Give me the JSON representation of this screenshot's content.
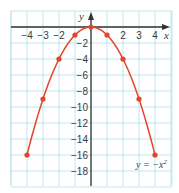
{
  "chart_data": {
    "type": "line",
    "title": "",
    "xlabel": "x",
    "ylabel": "y",
    "xlim": [
      -5,
      5
    ],
    "ylim": [
      -19.5,
      2
    ],
    "grid": true,
    "x_ticks": [
      -4,
      -3,
      -2,
      2,
      3,
      4
    ],
    "x_tick_labels": [
      "−4",
      "−3",
      "−2",
      "2",
      "3",
      "4"
    ],
    "y_ticks": [
      -2,
      -4,
      -6,
      -8,
      -10,
      -12,
      -14,
      -16,
      -18
    ],
    "y_tick_labels": [
      "−2",
      "−4",
      "−6",
      "−8",
      "−10",
      "−12",
      "−14",
      "−16",
      "−18"
    ],
    "series": [
      {
        "name": "y = −x²",
        "x": [
          -4,
          -3,
          -2,
          -1,
          0,
          1,
          2,
          3,
          4
        ],
        "y": [
          -16,
          -9,
          -4,
          -1,
          0,
          -1,
          -4,
          -9,
          -16
        ],
        "markers": true
      }
    ],
    "annotations": [
      {
        "text": "y = −x²",
        "x": 3.5,
        "y": -17.5
      }
    ]
  },
  "labels": {
    "x_axis": "x",
    "y_axis": "y",
    "equation_prefix": "y = −x",
    "equation_exp": "2"
  },
  "colors": {
    "grid": "#bfe5ea",
    "axis": "#333333",
    "curve": "#e5432b",
    "text": "#3a3a3a"
  }
}
